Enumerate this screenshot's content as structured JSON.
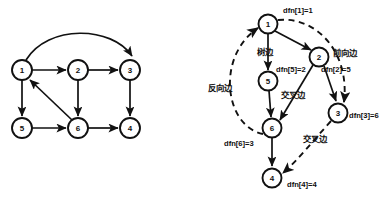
{
  "figure": {
    "background": "#ffffff",
    "ink": "#111111",
    "size": {
      "width": 392,
      "height": 201
    }
  },
  "left_graph": {
    "name": "directed-graph",
    "nodes": [
      {
        "id": "1",
        "label": "1",
        "cx": 22,
        "cy": 70,
        "r": 10
      },
      {
        "id": "2",
        "label": "2",
        "cx": 78,
        "cy": 70,
        "r": 10
      },
      {
        "id": "3",
        "label": "3",
        "cx": 130,
        "cy": 70,
        "r": 10
      },
      {
        "id": "5",
        "label": "5",
        "cx": 22,
        "cy": 128,
        "r": 10
      },
      {
        "id": "6",
        "label": "6",
        "cx": 78,
        "cy": 128,
        "r": 10
      },
      {
        "id": "4",
        "label": "4",
        "cx": 130,
        "cy": 128,
        "r": 10
      }
    ],
    "edges": [
      {
        "from": "1",
        "to": "3",
        "style": "curved-arc"
      },
      {
        "from": "1",
        "to": "2",
        "style": "straight"
      },
      {
        "from": "2",
        "to": "3",
        "style": "straight"
      },
      {
        "from": "1",
        "to": "5",
        "style": "straight"
      },
      {
        "from": "2",
        "to": "6",
        "style": "straight"
      },
      {
        "from": "3",
        "to": "4",
        "style": "straight"
      },
      {
        "from": "5",
        "to": "6",
        "style": "straight"
      },
      {
        "from": "6",
        "to": "4",
        "style": "straight"
      },
      {
        "from": "6",
        "to": "1",
        "style": "diagonal"
      }
    ]
  },
  "right_graph": {
    "name": "dfs-tree",
    "nodes": [
      {
        "id": "1",
        "label": "1",
        "cx": 268,
        "cy": 24,
        "r": 9.5
      },
      {
        "id": "2",
        "label": "2",
        "cx": 319,
        "cy": 57,
        "r": 9.5
      },
      {
        "id": "5",
        "label": "5",
        "cx": 268,
        "cy": 81,
        "r": 9.5
      },
      {
        "id": "3",
        "label": "3",
        "cx": 338,
        "cy": 113,
        "r": 9.5
      },
      {
        "id": "6",
        "label": "6",
        "cx": 272,
        "cy": 128,
        "r": 9.5
      },
      {
        "id": "4",
        "label": "4",
        "cx": 272,
        "cy": 178,
        "r": 9.5
      }
    ],
    "tree_edges": [
      {
        "from": "1",
        "to": "5"
      },
      {
        "from": "1",
        "to": "2"
      },
      {
        "from": "5",
        "to": "6"
      },
      {
        "from": "2",
        "to": "6"
      },
      {
        "from": "2",
        "to": "3"
      },
      {
        "from": "6",
        "to": "4"
      }
    ],
    "dashed_edges": [
      {
        "from": "1",
        "to": "3",
        "kind": "forward"
      },
      {
        "from": "6",
        "to": "1",
        "kind": "back"
      },
      {
        "from": "3",
        "to": "4",
        "kind": "cross"
      }
    ],
    "dfn_labels": [
      {
        "key": "dfn[1]",
        "text": "dfn[1]=1",
        "x": 283,
        "y": 13
      },
      {
        "key": "dfn[5]",
        "text": "dfn[5]=2",
        "x": 276,
        "y": 72
      },
      {
        "key": "dfn[2]",
        "text": "dfn[2]=5",
        "x": 321,
        "y": 72
      },
      {
        "key": "dfn[3]",
        "text": "dfn[3]=6",
        "x": 349,
        "y": 118
      },
      {
        "key": "dfn[6]",
        "text": "dfn[6]=3",
        "x": 224,
        "y": 146
      },
      {
        "key": "dfn[4]",
        "text": "dfn[4]=4",
        "x": 287,
        "y": 187
      }
    ],
    "edge_type_labels": [
      {
        "key": "tree-edge",
        "text": "树边",
        "x": 257,
        "y": 55
      },
      {
        "key": "forward-edge",
        "text": "前向边",
        "x": 333,
        "y": 56
      },
      {
        "key": "back-edge",
        "text": "反向边",
        "x": 208,
        "y": 91
      },
      {
        "key": "cross-edge-1",
        "text": "交叉边",
        "x": 281,
        "y": 98
      },
      {
        "key": "cross-edge-2",
        "text": "交叉边",
        "x": 303,
        "y": 142
      }
    ]
  }
}
